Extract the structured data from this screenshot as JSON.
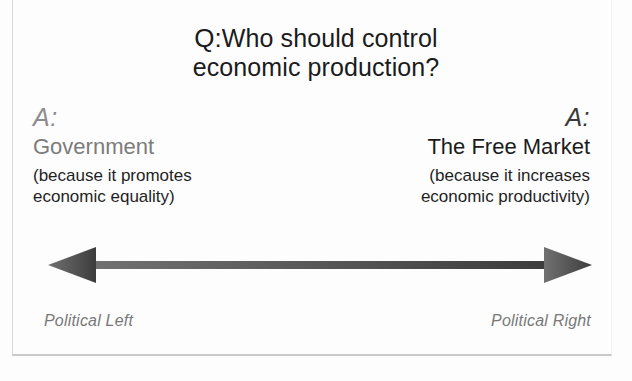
{
  "question": {
    "marker": "Q:",
    "line1": "Who should control",
    "line2": "economic production?"
  },
  "answers": {
    "left": {
      "marker": "A:",
      "title": "Government",
      "reason_line1": "(because it promotes",
      "reason_line2": "economic equality)",
      "color": "#7c7c7c"
    },
    "right": {
      "marker": "A:",
      "title": "The Free Market",
      "reason_line1": "(because it increases",
      "reason_line2": "economic productivity)",
      "color": "#1b1b1b"
    }
  },
  "axis": {
    "left_label": "Political Left",
    "right_label": "Political Right",
    "arrow_color_left": "#6f6f6f",
    "arrow_color_right": "#3f3f3f",
    "icon": "double-headed-arrow"
  }
}
